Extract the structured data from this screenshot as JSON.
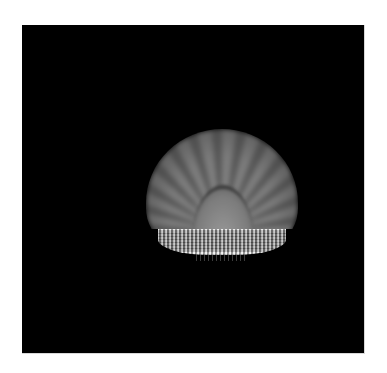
{
  "image": {
    "subject": "fluted scallop-shell dome with calligraphic inscription band",
    "background_color": "#000000",
    "page_color": "#ffffff",
    "dome_color": "#8a8a8a",
    "band_color": "#b0b0b0"
  }
}
